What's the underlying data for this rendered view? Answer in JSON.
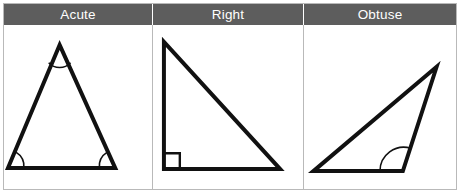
{
  "figure": {
    "columns": [
      {
        "key": "acute",
        "header": "Acute",
        "shape_name": "acute-triangle",
        "marker": "three-angle-arcs"
      },
      {
        "key": "right",
        "header": "Right",
        "shape_name": "right-triangle",
        "marker": "right-angle-square"
      },
      {
        "key": "obtuse",
        "header": "Obtuse",
        "shape_name": "obtuse-triangle",
        "marker": "obtuse-angle-arc"
      }
    ]
  },
  "colors": {
    "header_background": "#5d5d5d",
    "header_text": "#ffffff",
    "cell_background": "#ffffff",
    "grid_border": "#b9b9b9",
    "stroke": "#111111"
  },
  "geometry": {
    "acute": {
      "points": "56,20 112,144 4,144",
      "arcs": [
        "M 45,38 A 15 15 0 0 0 67,38",
        "M 20,144 A 17 17 0 0 0 12,128",
        "M 96,144 A 17 17 0 0 1 104,128"
      ]
    },
    "right": {
      "points": "11,17 128,145 11,145",
      "right_angle_square": "M 11,129 L 27,129 L 27,145"
    },
    "obtuse": {
      "points": "133,42 99,147 9,147",
      "arc": "M 76,147 A 24 24 0 0 1 107,124"
    }
  }
}
